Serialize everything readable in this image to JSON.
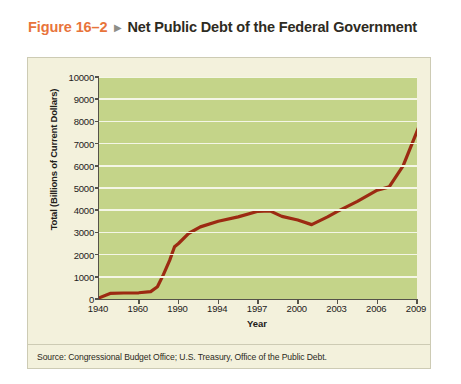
{
  "figure": {
    "number_label": "Figure 16–2",
    "arrow_glyph": "▶",
    "title": "Net Public Debt of the Federal Government"
  },
  "source": {
    "text": "Source: Congressional Budget Office; U.S. Treasury, Office of the Public Debt."
  },
  "colors": {
    "figure_number": "#e8743b",
    "title": "#2e2b22",
    "panel_background": "#f3f1dc",
    "panel_border": "#cdcbb4",
    "plot_background": "#c4d489",
    "gridline": "#f4f6e6",
    "axis": "#55524a",
    "series_line": "#9c2a12"
  },
  "chart_data": {
    "type": "line",
    "title": "Net Public Debt of the Federal Government",
    "xlabel": "Year",
    "ylabel": "Total (Billions of Current Dollars)",
    "ylim": [
      0,
      10000
    ],
    "ytick_values": [
      0,
      1000,
      2000,
      3000,
      4000,
      5000,
      6000,
      7000,
      8000,
      9000,
      10000
    ],
    "ytick_labels": [
      "0",
      "1000",
      "2000",
      "3000",
      "4000",
      "5000",
      "6000",
      "7000",
      "8000",
      "9000",
      "10000"
    ],
    "xtick_labels": [
      "1940",
      "1960",
      "1990",
      "1994",
      "1997",
      "2000",
      "2003",
      "2006",
      "2009"
    ],
    "xtick_positions": [
      0,
      1,
      2,
      3,
      4,
      5,
      6,
      7,
      8
    ],
    "grid": "horizontal",
    "legend": "none",
    "series": [
      {
        "name": "Net Public Debt",
        "color": "#9c2a12",
        "points": [
          {
            "x": 0.0,
            "label": "1940",
            "y": 50
          },
          {
            "x": 0.28,
            "label": "1950",
            "y": 250
          },
          {
            "x": 0.62,
            "label": "1957",
            "y": 270
          },
          {
            "x": 1.0,
            "label": "1960",
            "y": 280
          },
          {
            "x": 1.3,
            "label": "1975",
            "y": 330
          },
          {
            "x": 1.47,
            "label": "1980",
            "y": 550
          },
          {
            "x": 1.62,
            "label": "1983",
            "y": 1100
          },
          {
            "x": 1.78,
            "label": "1986",
            "y": 1750
          },
          {
            "x": 1.9,
            "label": "1988",
            "y": 2350
          },
          {
            "x": 2.0,
            "label": "1990",
            "y": 2500
          },
          {
            "x": 2.25,
            "label": "1991",
            "y": 2950
          },
          {
            "x": 2.55,
            "label": "1992",
            "y": 3250
          },
          {
            "x": 3.0,
            "label": "1994",
            "y": 3500
          },
          {
            "x": 3.5,
            "label": "1995",
            "y": 3700
          },
          {
            "x": 4.0,
            "label": "1997",
            "y": 3950
          },
          {
            "x": 4.3,
            "label": "1998",
            "y": 3970
          },
          {
            "x": 4.6,
            "label": "1999",
            "y": 3720
          },
          {
            "x": 5.0,
            "label": "2000",
            "y": 3560
          },
          {
            "x": 5.35,
            "label": "2001",
            "y": 3350
          },
          {
            "x": 5.75,
            "label": "2002",
            "y": 3700
          },
          {
            "x": 6.0,
            "label": "2003",
            "y": 3950
          },
          {
            "x": 6.5,
            "label": "2004",
            "y": 4400
          },
          {
            "x": 7.0,
            "label": "2006",
            "y": 4900
          },
          {
            "x": 7.3,
            "label": "2007",
            "y": 5050
          },
          {
            "x": 7.65,
            "label": "2008",
            "y": 6000
          },
          {
            "x": 8.0,
            "label": "2009",
            "y": 7550
          },
          {
            "x": 8.4,
            "label": "2010",
            "y": 9400
          }
        ]
      }
    ]
  }
}
